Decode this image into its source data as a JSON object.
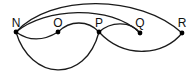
{
  "diagram": {
    "type": "multigraph",
    "nodes": [
      {
        "id": "N",
        "label": "N",
        "x": 16,
        "y": 32
      },
      {
        "id": "O",
        "label": "O",
        "x": 58,
        "y": 32
      },
      {
        "id": "P",
        "label": "P",
        "x": 99,
        "y": 32
      },
      {
        "id": "Q",
        "label": "Q",
        "x": 140,
        "y": 33
      },
      {
        "id": "R",
        "label": "R",
        "x": 182,
        "y": 33
      }
    ],
    "edges": [
      {
        "from": "N",
        "to": "R"
      },
      {
        "from": "N",
        "to": "Q"
      },
      {
        "from": "N",
        "to": "O"
      },
      {
        "from": "O",
        "to": "P"
      },
      {
        "from": "P",
        "to": "Q"
      },
      {
        "from": "N",
        "to": "P"
      },
      {
        "from": "P",
        "to": "R"
      }
    ],
    "colors": {
      "stroke": "#1a1a1a",
      "node": "#000000",
      "background": "#ffffff"
    }
  }
}
